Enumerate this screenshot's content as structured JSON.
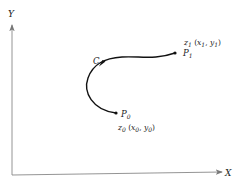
{
  "diagram": {
    "axes": {
      "x_label": "X",
      "y_label": "Y"
    },
    "curve": {
      "label": "C"
    },
    "points": [
      {
        "name": "P",
        "index": "0",
        "z_name": "z",
        "z_index": "0",
        "coord_open": "(",
        "x_name": "x",
        "x_index": "0",
        "sep": ", ",
        "y_name": "y",
        "y_index": "0",
        "coord_close": ")"
      },
      {
        "name": "P",
        "index": "1",
        "z_name": "z",
        "z_index": "1",
        "coord_open": "(",
        "x_name": "x",
        "x_index": "1",
        "sep": ", ",
        "y_name": "y",
        "y_index": "1",
        "coord_close": ")"
      }
    ],
    "colors": {
      "axis": "#777777",
      "curve": "#111111",
      "text": "#222222"
    }
  }
}
